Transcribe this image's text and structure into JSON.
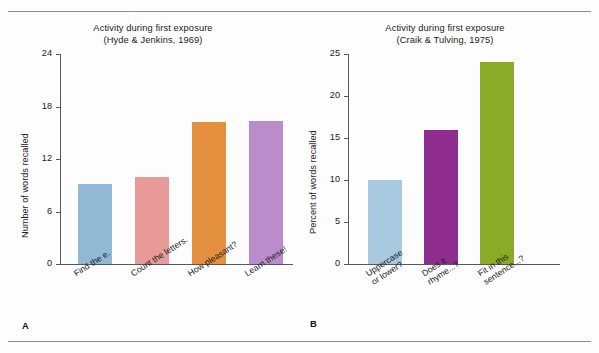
{
  "figure": {
    "background_color": "#fdfdfd",
    "rule_color": "#8a8f94",
    "axis_color": "#55595d"
  },
  "panels": [
    {
      "letter": "A",
      "title_line1": "Activity during first exposure",
      "title_line2": "(Hyde & Jenkins, 1969)"
    },
    {
      "letter": "B",
      "title_line1": "Activity during first exposure",
      "title_line2": "(Craik & Tulving, 1975)"
    }
  ],
  "chart_data": [
    {
      "type": "bar",
      "panel": "A",
      "title": "Activity during first exposure (Hyde & Jenkins, 1969)",
      "title_line1": "Activity during first exposure",
      "title_line2": "(Hyde & Jenkins, 1969)",
      "xlabel": "",
      "ylabel": "Number of words recalled",
      "ylim": [
        0,
        24
      ],
      "yticks": [
        0,
        6,
        12,
        18,
        24
      ],
      "ytick_labels": [
        "0",
        "6",
        "12",
        "18",
        "24"
      ],
      "grid": false,
      "legend": "none",
      "categories": [
        "Find the e.",
        "Count the letters.",
        "How pleasant?",
        "Learn these!"
      ],
      "category_lines": [
        [
          "Find the e.",
          ""
        ],
        [
          "Count the letters.",
          ""
        ],
        [
          "How pleasant?",
          ""
        ],
        [
          "Learn these!",
          ""
        ]
      ],
      "values": [
        9.2,
        9.9,
        16.2,
        16.4
      ],
      "colors": [
        "#91b9d6",
        "#e89a98",
        "#e4903f",
        "#bb8ccb"
      ]
    },
    {
      "type": "bar",
      "panel": "B",
      "title": "Activity during first exposure (Craik & Tulving, 1975)",
      "title_line1": "Activity during first exposure",
      "title_line2": "(Craik & Tulving, 1975)",
      "xlabel": "",
      "ylabel": "Percent of words recalled",
      "ylim": [
        0,
        25
      ],
      "yticks": [
        0,
        5,
        10,
        15,
        20,
        25
      ],
      "ytick_labels": [
        "0",
        "5",
        "10",
        "15",
        "20",
        "25"
      ],
      "grid": false,
      "legend": "none",
      "categories": [
        "Uppercase or lower?",
        "Does it rhyme...?",
        "Fit in this sentence...?"
      ],
      "category_lines": [
        [
          "Uppercase",
          "or lower?"
        ],
        [
          "Does it",
          "rhyme...?"
        ],
        [
          "Fit in this",
          "sentence...?"
        ]
      ],
      "values": [
        10,
        16,
        24
      ],
      "colors": [
        "#a8c9e0",
        "#8e2d8e",
        "#8aab28"
      ]
    }
  ]
}
